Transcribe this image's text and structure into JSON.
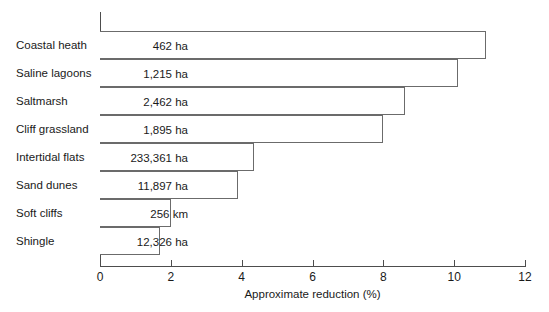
{
  "chart_data": {
    "type": "bar",
    "orientation": "horizontal",
    "title": "",
    "xlabel": "Approximate reduction (%)",
    "ylabel": "",
    "xlim": [
      0,
      12
    ],
    "ylim": null,
    "grid": false,
    "legend": null,
    "xticks": [
      0,
      2,
      4,
      6,
      8,
      10,
      12
    ],
    "xtick_labels": [
      "0",
      "2",
      "4",
      "6",
      "8",
      "10",
      "12"
    ],
    "categories": [
      "Coastal heath",
      "Saline lagoons",
      "Saltmarsh",
      "Cliff grassland",
      "Intertidal flats",
      "Sand dunes",
      "Soft cliffs",
      "Shingle"
    ],
    "values": [
      10.9,
      10.1,
      8.6,
      8.0,
      4.35,
      3.9,
      2.0,
      1.7
    ],
    "annotations": [
      "462 ha",
      "1,215 ha",
      "2,462 ha",
      "1,895 ha",
      "233,361 ha",
      "11,897 ha",
      "256 km",
      "12,326 ha"
    ],
    "bars": [
      {
        "category": "Coastal heath",
        "value": 10.9,
        "label": "462 ha"
      },
      {
        "category": "Saline lagoons",
        "value": 10.1,
        "label": "1,215 ha"
      },
      {
        "category": "Saltmarsh",
        "value": 8.6,
        "label": "2,462 ha"
      },
      {
        "category": "Cliff grassland",
        "value": 8.0,
        "label": "1,895 ha"
      },
      {
        "category": "Intertidal flats",
        "value": 4.35,
        "label": "233,361 ha"
      },
      {
        "category": "Sand dunes",
        "value": 3.9,
        "label": "11,897 ha"
      },
      {
        "category": "Soft cliffs",
        "value": 2.0,
        "label": "256 km"
      },
      {
        "category": "Shingle",
        "value": 1.7,
        "label": "12,326 ha"
      }
    ],
    "colors": {
      "bar_fill": "#ffffff",
      "bar_stroke": "#6b6b6b",
      "axis": "#4d4d4d",
      "text": "#1a1a1a",
      "background": "#ffffff"
    }
  }
}
